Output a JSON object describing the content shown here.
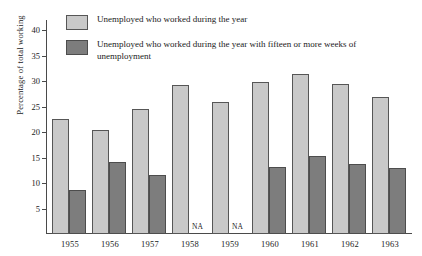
{
  "chart_data": {
    "type": "bar",
    "title": "",
    "xlabel": "",
    "ylabel": "Percentage of total working",
    "ylim": [
      0,
      42
    ],
    "yticks": [
      5,
      10,
      15,
      20,
      25,
      30,
      35,
      40
    ],
    "grid": false,
    "legend_position": "top-left",
    "categories": [
      "1955",
      "1956",
      "1957",
      "1958",
      "1959",
      "1960",
      "1961",
      "1962",
      "1963"
    ],
    "series": [
      {
        "name": "Unemployed who worked during the year",
        "color": "#c9c9c9",
        "values": [
          22.6,
          20.4,
          24.5,
          29.2,
          25.9,
          29.8,
          31.5,
          29.4,
          26.8
        ]
      },
      {
        "name": "Unemployed who worked during the year with fifteen or more weeks of unemployment",
        "color": "#7d7d7d",
        "values": [
          8.6,
          14.1,
          11.6,
          null,
          null,
          13.2,
          15.3,
          13.7,
          12.9
        ],
        "missing_label": "NA"
      }
    ],
    "annotations": [
      {
        "category": "1958",
        "series": 1,
        "text": "NA"
      },
      {
        "category": "1959",
        "series": 1,
        "text": "NA"
      }
    ]
  },
  "legend": {
    "items": [
      {
        "label": "Unemployed who worked during the year",
        "color": "#c9c9c9"
      },
      {
        "label": "Unemployed who worked during the year with fifteen or more weeks of unemployment",
        "color": "#7d7d7d"
      }
    ]
  },
  "axis": {
    "y_title": "Percentage of total working"
  }
}
